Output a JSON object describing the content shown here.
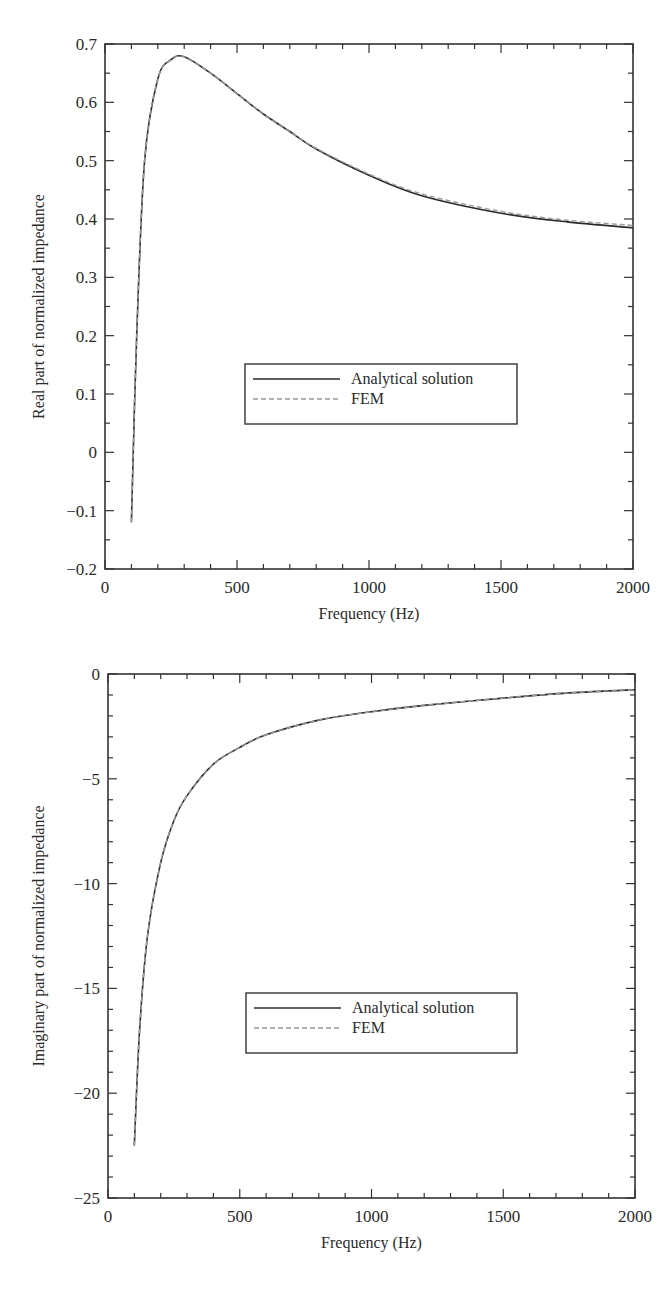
{
  "chart_data": [
    {
      "type": "line",
      "title": "",
      "xlabel": "Frequency (Hz)",
      "ylabel": "Real part of normalized impedance",
      "xlim": [
        0,
        2000
      ],
      "ylim": [
        -0.2,
        0.7
      ],
      "xticks": [
        0,
        500,
        1000,
        1500,
        2000
      ],
      "yticks": [
        -0.2,
        -0.1,
        0,
        0.1,
        0.2,
        0.3,
        0.4,
        0.5,
        0.6,
        0.7
      ],
      "ytick_labels": [
        "−0.2",
        "−0.1",
        "0",
        "0.1",
        "0.2",
        "0.3",
        "0.4",
        "0.5",
        "0.6",
        "0.7"
      ],
      "grid": false,
      "legend_position": "center",
      "x": [
        100,
        120,
        150,
        200,
        250,
        300,
        400,
        500,
        600,
        700,
        800,
        1000,
        1200,
        1500,
        1750,
        2000
      ],
      "series": [
        {
          "name": "Analytical solution",
          "style": "solid",
          "color": "#2a2a2a",
          "values": [
            -0.12,
            0.2,
            0.5,
            0.64,
            0.673,
            0.678,
            0.65,
            0.615,
            0.58,
            0.55,
            0.52,
            0.475,
            0.44,
            0.41,
            0.395,
            0.385
          ]
        },
        {
          "name": "FEM",
          "style": "dashed",
          "color": "#9a9a9a",
          "values": [
            -0.12,
            0.2,
            0.5,
            0.64,
            0.673,
            0.678,
            0.65,
            0.615,
            0.58,
            0.55,
            0.521,
            0.477,
            0.443,
            0.413,
            0.398,
            0.389
          ]
        }
      ]
    },
    {
      "type": "line",
      "title": "",
      "xlabel": "Frequency (Hz)",
      "ylabel": "Imaginary part of normalized impedance",
      "xlim": [
        0,
        2000
      ],
      "ylim": [
        -25,
        0
      ],
      "xticks": [
        0,
        500,
        1000,
        1500,
        2000
      ],
      "yticks": [
        -25,
        -20,
        -15,
        -10,
        -5,
        0
      ],
      "ytick_labels": [
        "−25",
        "−20",
        "−15",
        "−10",
        "−5",
        "0"
      ],
      "grid": false,
      "legend_position": "center",
      "x": [
        100,
        120,
        150,
        200,
        250,
        300,
        400,
        500,
        600,
        800,
        1000,
        1200,
        1500,
        1750,
        2000
      ],
      "series": [
        {
          "name": "Analytical solution",
          "style": "solid",
          "color": "#2a2a2a",
          "values": [
            -22.5,
            -17,
            -12.5,
            -9,
            -7,
            -5.8,
            -4.3,
            -3.5,
            -2.9,
            -2.2,
            -1.8,
            -1.5,
            -1.15,
            -0.9,
            -0.75
          ]
        },
        {
          "name": "FEM",
          "style": "dashed",
          "color": "#9a9a9a",
          "values": [
            -22.5,
            -17,
            -12.5,
            -9,
            -7,
            -5.8,
            -4.3,
            -3.5,
            -2.9,
            -2.2,
            -1.8,
            -1.5,
            -1.15,
            -0.9,
            -0.75
          ]
        }
      ]
    }
  ],
  "top": {
    "xlabel": "Frequency (Hz)",
    "ylabel": "Real part of normalized impedance",
    "legend": {
      "items": [
        "Analytical solution",
        "FEM"
      ]
    }
  },
  "bottom": {
    "xlabel": "Frequency (Hz)",
    "ylabel": "Imaginary part of normalized impedance",
    "legend": {
      "items": [
        "Analytical solution",
        "FEM"
      ]
    }
  }
}
